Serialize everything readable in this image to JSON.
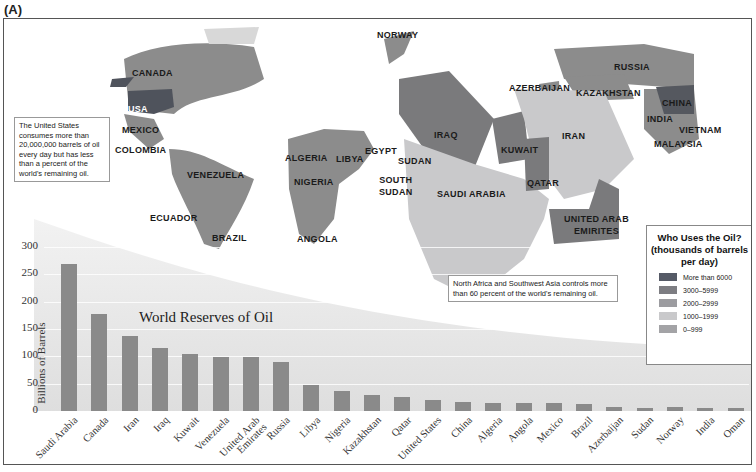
{
  "panel_label": "(A)",
  "map": {
    "labels": [
      {
        "name": "CANADA",
        "x": 128,
        "y": 48
      },
      {
        "name": "USA",
        "x": 124,
        "y": 84,
        "light": true
      },
      {
        "name": "MEXICO",
        "x": 118,
        "y": 105
      },
      {
        "name": "COLOMBIA",
        "x": 111,
        "y": 125
      },
      {
        "name": "VENEZUELA",
        "x": 183,
        "y": 150
      },
      {
        "name": "ECUADOR",
        "x": 146,
        "y": 193
      },
      {
        "name": "BRAZIL",
        "x": 208,
        "y": 213
      },
      {
        "name": "NORWAY",
        "x": 373,
        "y": 10
      },
      {
        "name": "ALGERIA",
        "x": 281,
        "y": 133
      },
      {
        "name": "LIBYA",
        "x": 332,
        "y": 134
      },
      {
        "name": "EGYPT",
        "x": 361,
        "y": 126
      },
      {
        "name": "SUDAN",
        "x": 394,
        "y": 136
      },
      {
        "name": "NIGERIA",
        "x": 290,
        "y": 157
      },
      {
        "name": "SOUTH\nSUDAN",
        "x": 375,
        "y": 155
      },
      {
        "name": "ANGOLA",
        "x": 293,
        "y": 214
      },
      {
        "name": "IRAQ",
        "x": 430,
        "y": 110
      },
      {
        "name": "KUWAIT",
        "x": 497,
        "y": 125
      },
      {
        "name": "IRAN",
        "x": 558,
        "y": 111
      },
      {
        "name": "SAUDI ARABIA",
        "x": 433,
        "y": 169
      },
      {
        "name": "QATAR",
        "x": 523,
        "y": 158
      },
      {
        "name": "UNITED ARAB\nEMIRITES",
        "x": 560,
        "y": 194
      },
      {
        "name": "AZERBAIJAN",
        "x": 505,
        "y": 63
      },
      {
        "name": "KAZAKHSTAN",
        "x": 572,
        "y": 68
      },
      {
        "name": "RUSSIA",
        "x": 610,
        "y": 42
      },
      {
        "name": "CHINA",
        "x": 658,
        "y": 78
      },
      {
        "name": "INDIA",
        "x": 643,
        "y": 94
      },
      {
        "name": "VIETNAM",
        "x": 675,
        "y": 105
      },
      {
        "name": "MALAYSIA",
        "x": 650,
        "y": 119
      }
    ],
    "notes": {
      "usa": "The United States consumes more than 20,000,000 barrels of oil every day but has less than a percent of the world's remaining oil.",
      "mideast": "North Africa and Southwest Asia controls more than 60 percent of the world's remaining oil."
    }
  },
  "legend": {
    "title": "Who Uses the Oil? (thousands of barrels per day)",
    "items": [
      {
        "label": "More than 6000",
        "color": "#555a66"
      },
      {
        "label": "3000–5999",
        "color": "#7d7d82"
      },
      {
        "label": "2000–2999",
        "color": "#9c9ca0"
      },
      {
        "label": "1000–1999",
        "color": "#c9c9cb"
      },
      {
        "label": "0–999",
        "color": "#a3a3a6"
      }
    ]
  },
  "chart_data": {
    "type": "bar",
    "title": "World Reserves of Oil",
    "xlabel": "",
    "ylabel": "Billions of Barrels",
    "ylim": [
      0,
      300
    ],
    "yticks": [
      0,
      50,
      100,
      150,
      200,
      250,
      300
    ],
    "grid": true,
    "categories": [
      "Saudi Arabia",
      "Canada",
      "Iran",
      "Iraq",
      "Kuwait",
      "Venezuela",
      "United Arab Emirates",
      "Russia",
      "Libya",
      "Nigeria",
      "Kazakhstan",
      "Qatar",
      "United States",
      "China",
      "Algeria",
      "Angola",
      "Mexico",
      "Brazil",
      "Azerbaijan",
      "Sudan",
      "Norway",
      "India",
      "Oman"
    ],
    "category_display": [
      "Saudi Arabia",
      "Canada",
      "Iran",
      "Iraq",
      "Kuwait",
      "Venezuela",
      "United Arab\nEmirates",
      "Russia",
      "Libya",
      "Nigeria",
      "Kazakhstan",
      "Qatar",
      "United States",
      "China",
      "Algeria",
      "Angola",
      "Mexico",
      "Brazil",
      "Azerbaijan",
      "Sudan",
      "Norway",
      "India",
      "Oman"
    ],
    "values": [
      268,
      178,
      137,
      115,
      104,
      99,
      98,
      90,
      47,
      37,
      30,
      25,
      21,
      16,
      15,
      14,
      14,
      12,
      7,
      6,
      7,
      6,
      5
    ],
    "bar_color": "#8a8a8a"
  }
}
